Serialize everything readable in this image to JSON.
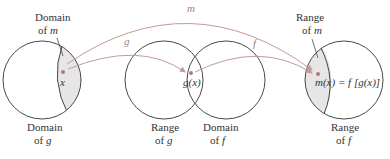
{
  "diagram": {
    "colors": {
      "circle_stroke": "#333333",
      "shade": "#e6e6e6",
      "arrow": "#c49a9a",
      "dot": "#b07878",
      "label": "#333333"
    },
    "sets": [
      {
        "id": "domain-g",
        "label_line1": "Domain",
        "label_line2_prefix": "of ",
        "label_line2_var": "g"
      },
      {
        "id": "range-g",
        "label_line1": "Range",
        "label_line2_prefix": "of ",
        "label_line2_var": "g"
      },
      {
        "id": "domain-f",
        "label_line1": "Domain",
        "label_line2_prefix": "of ",
        "label_line2_var": "f"
      },
      {
        "id": "range-f",
        "label_line1": "Range",
        "label_line2_prefix": "of ",
        "label_line2_var": "f"
      }
    ],
    "subsets": [
      {
        "id": "domain-m",
        "label_line1": "Domain",
        "label_line2_prefix": "of ",
        "label_line2_var": "m"
      },
      {
        "id": "range-m",
        "label_line1": "Range",
        "label_line2_prefix": "of ",
        "label_line2_var": "m"
      }
    ],
    "points": {
      "x": "x",
      "gx": "g(x)",
      "mx": "m(x) = f [g(x)]"
    },
    "arrows": {
      "m": "m",
      "g": "g",
      "f": "f"
    }
  }
}
